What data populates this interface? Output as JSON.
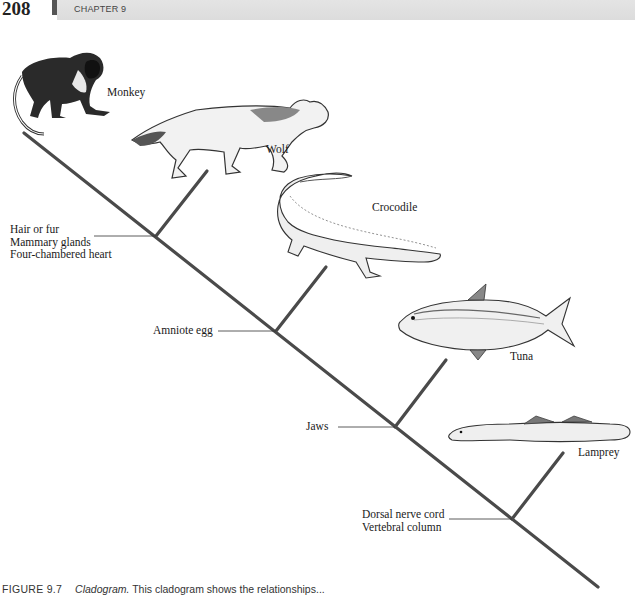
{
  "header": {
    "page_number": "208",
    "chapter": "CHAPTER 9"
  },
  "cladogram": {
    "line_color": "#4a4a4a",
    "main_axis": {
      "x1": 24,
      "y1": 133,
      "x2": 598,
      "y2": 587
    },
    "taxa": [
      {
        "name": "Monkey",
        "icon": "monkey-illustration"
      },
      {
        "name": "Wolf",
        "icon": "wolf-illustration"
      },
      {
        "name": "Crocodile",
        "icon": "crocodile-illustration"
      },
      {
        "name": "Tuna",
        "icon": "tuna-illustration"
      },
      {
        "name": "Lamprey",
        "icon": "lamprey-illustration"
      }
    ],
    "nodes": [
      {
        "lines": [
          "Hair or fur",
          "Mammary glands",
          "Four-chambered heart"
        ],
        "x": 156,
        "y": 236,
        "branch_to": [
          207,
          171
        ]
      },
      {
        "lines": [
          "Amniote egg"
        ],
        "x": 276,
        "y": 331,
        "branch_to": [
          326,
          267
        ]
      },
      {
        "lines": [
          "Jaws"
        ],
        "x": 395,
        "y": 427,
        "branch_to": [
          446,
          360
        ]
      },
      {
        "lines": [
          "Dorsal nerve cord",
          "Vertebral column"
        ],
        "x": 512,
        "y": 519,
        "branch_to": [
          563,
          453
        ]
      }
    ]
  },
  "caption": {
    "figure_label": "FIGURE 9.7",
    "title": "Cladogram.",
    "text": "This cladogram shows the relationships..."
  }
}
